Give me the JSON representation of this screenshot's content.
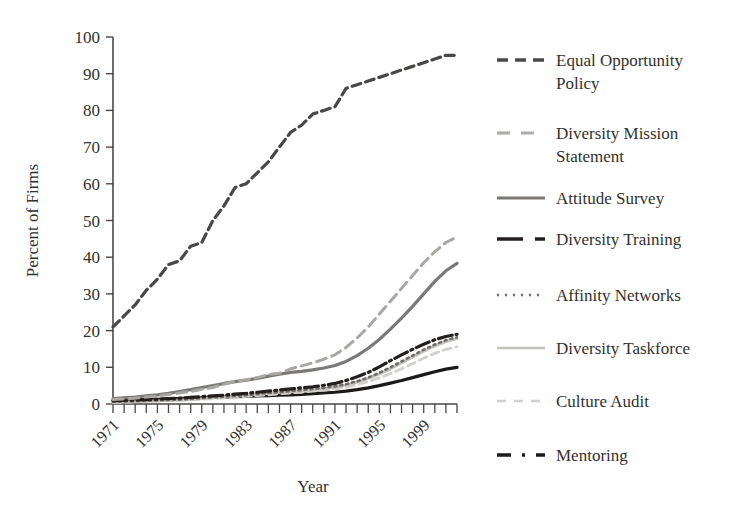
{
  "chart_data": {
    "type": "line",
    "title": "",
    "xlabel": "Year",
    "ylabel": "Percent of Firms",
    "xlim": [
      1971,
      2002
    ],
    "ylim": [
      0,
      100
    ],
    "grid": false,
    "legend_position": "right",
    "ytick_labels": [
      "100",
      "90",
      "80",
      "70",
      "60",
      "50",
      "40",
      "30",
      "20",
      "10",
      "0"
    ],
    "ytick_values": [
      100,
      90,
      80,
      70,
      60,
      50,
      40,
      30,
      20,
      10,
      0
    ],
    "xtick_labels": [
      "1971",
      "1975",
      "1979",
      "1983",
      "1987",
      "1991",
      "1995",
      "1999"
    ],
    "xtick_values": [
      1971,
      1975,
      1979,
      1983,
      1987,
      1991,
      1995,
      1999
    ],
    "x": [
      1971,
      1972,
      1973,
      1974,
      1975,
      1976,
      1977,
      1978,
      1979,
      1980,
      1981,
      1982,
      1983,
      1984,
      1985,
      1986,
      1987,
      1988,
      1989,
      1990,
      1991,
      1992,
      1993,
      1994,
      1995,
      1996,
      1997,
      1998,
      1999,
      2000,
      2001,
      2002
    ],
    "series": [
      {
        "name": "Equal Opportunity Policy",
        "style": "dashed",
        "color": "#4a4846",
        "width": 3.2,
        "dash": "9,5",
        "values": [
          21,
          24,
          27,
          31,
          34,
          38,
          39,
          43,
          44,
          50,
          54,
          59,
          60,
          63,
          66,
          70,
          74,
          76,
          79,
          80,
          81,
          86,
          87,
          88,
          89,
          90,
          91,
          92,
          93,
          94,
          95,
          95
        ]
      },
      {
        "name": "Diversity Mission Statement",
        "style": "dashed",
        "color": "#a9a7a4",
        "width": 3.0,
        "dash": "10,6",
        "values": [
          1.2,
          1.4,
          1.6,
          1.9,
          2.2,
          2.6,
          3.0,
          3.4,
          4.0,
          4.5,
          5.4,
          6.2,
          6.6,
          7.2,
          8.0,
          8.4,
          9.6,
          10.4,
          11.2,
          12.2,
          13.4,
          15.4,
          18.0,
          21.0,
          24.5,
          28.0,
          31.5,
          35.0,
          38.5,
          41.5,
          44.0,
          45.5
        ]
      },
      {
        "name": "Attitude Survey",
        "style": "solid",
        "color": "#7b7977",
        "width": 3.2,
        "dash": "",
        "values": [
          1.5,
          1.7,
          1.9,
          2.2,
          2.5,
          2.9,
          3.4,
          3.9,
          4.5,
          5.0,
          5.6,
          6.1,
          6.5,
          7.0,
          7.6,
          8.1,
          8.6,
          8.9,
          9.3,
          9.8,
          10.5,
          11.6,
          13.2,
          15.2,
          17.6,
          20.4,
          23.4,
          26.6,
          30.0,
          33.4,
          36.3,
          38.3
        ]
      },
      {
        "name": "Diversity Training",
        "style": "dashdot",
        "color": "#231f1e",
        "width": 3.2,
        "dash": "14,4,2,4",
        "values": [
          0.9,
          1.0,
          1.1,
          1.2,
          1.3,
          1.5,
          1.6,
          1.8,
          2.0,
          2.2,
          2.4,
          2.7,
          2.9,
          3.2,
          3.5,
          3.8,
          4.1,
          4.4,
          4.7,
          5.1,
          5.6,
          6.4,
          7.4,
          8.6,
          10.1,
          11.8,
          13.4,
          14.9,
          16.3,
          17.5,
          18.4,
          19.0
        ]
      },
      {
        "name": "Affinity Networks",
        "style": "dotted",
        "color": "#6f6d6b",
        "width": 2.6,
        "dash": "2,4",
        "values": [
          0.6,
          0.7,
          0.8,
          0.9,
          1.0,
          1.1,
          1.2,
          1.4,
          1.6,
          1.8,
          2.0,
          2.2,
          2.4,
          2.7,
          3.0,
          3.2,
          3.5,
          3.8,
          4.1,
          4.4,
          4.8,
          5.4,
          6.2,
          7.2,
          8.5,
          10.0,
          11.6,
          13.2,
          14.8,
          16.2,
          17.4,
          18.2
        ]
      },
      {
        "name": "Diversity Taskforce",
        "style": "solid",
        "color": "#c3c1be",
        "width": 3.0,
        "dash": "",
        "values": [
          0.5,
          0.6,
          0.7,
          0.8,
          0.9,
          1.0,
          1.1,
          1.3,
          1.5,
          1.7,
          1.9,
          2.1,
          2.3,
          2.6,
          2.9,
          3.1,
          3.4,
          3.6,
          3.9,
          4.2,
          4.6,
          5.2,
          6.0,
          7.0,
          8.2,
          9.6,
          11.2,
          12.8,
          14.4,
          15.8,
          17.0,
          17.8
        ]
      },
      {
        "name": "Culture Audit",
        "style": "dashed",
        "color": "#d2d0cd",
        "width": 2.8,
        "dash": "8,5",
        "values": [
          0.4,
          0.5,
          0.6,
          0.7,
          0.8,
          0.9,
          1.0,
          1.1,
          1.3,
          1.5,
          1.7,
          1.9,
          2.1,
          2.3,
          2.5,
          2.8,
          3.0,
          3.2,
          3.5,
          3.8,
          4.1,
          4.6,
          5.3,
          6.1,
          7.1,
          8.3,
          9.6,
          11.0,
          12.5,
          13.8,
          14.9,
          15.6
        ]
      },
      {
        "name": "Mentoring",
        "style": "dashdotdot",
        "color": "#1c1a19",
        "width": 3.2,
        "dash": "1,0",
        "values": [
          0.9,
          1.0,
          1.1,
          1.2,
          1.3,
          1.4,
          1.5,
          1.6,
          1.7,
          1.8,
          1.9,
          2.0,
          2.1,
          2.2,
          2.3,
          2.4,
          2.5,
          2.6,
          2.8,
          3.0,
          3.2,
          3.5,
          3.9,
          4.4,
          5.0,
          5.7,
          6.4,
          7.2,
          8.0,
          8.8,
          9.5,
          10.0
        ]
      }
    ]
  },
  "legend": {
    "entries": [
      {
        "label_line1": "Equal Opportunity",
        "label_line2": "Policy",
        "swatch": "dashed-dark"
      },
      {
        "label_line1": "Diversity Mission",
        "label_line2": "Statement",
        "swatch": "dashed-gray"
      },
      {
        "label_line1": "Attitude Survey",
        "label_line2": "",
        "swatch": "solid-gray"
      },
      {
        "label_line1": "Diversity Training",
        "label_line2": "",
        "swatch": "dashdot-dark"
      },
      {
        "label_line1": "Affinity Networks",
        "label_line2": "",
        "swatch": "dotted-gray"
      },
      {
        "label_line1": "Diversity Taskforce",
        "label_line2": "",
        "swatch": "solid-light"
      },
      {
        "label_line1": "Culture Audit",
        "label_line2": "",
        "swatch": "dashed-light"
      },
      {
        "label_line1": "Mentoring",
        "label_line2": "",
        "swatch": "dashdotdot-dark"
      }
    ]
  }
}
